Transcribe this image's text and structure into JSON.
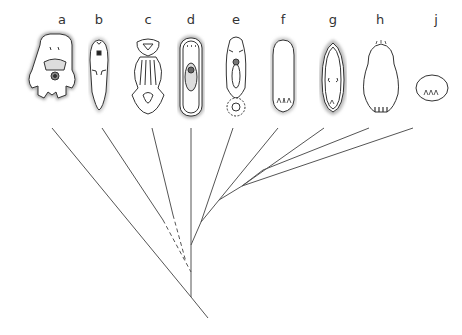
{
  "diagram": {
    "type": "phylogenetic-tree",
    "taxa": [
      {
        "label": "a",
        "x": 62
      },
      {
        "label": "b",
        "x": 99
      },
      {
        "label": "c",
        "x": 148
      },
      {
        "label": "d",
        "x": 191
      },
      {
        "label": "e",
        "x": 236
      },
      {
        "label": "f",
        "x": 283
      },
      {
        "label": "g",
        "x": 333
      },
      {
        "label": "h",
        "x": 380
      },
      {
        "label": "j",
        "x": 436
      }
    ],
    "line_color": "#555555",
    "drawing_color": "#333333"
  }
}
